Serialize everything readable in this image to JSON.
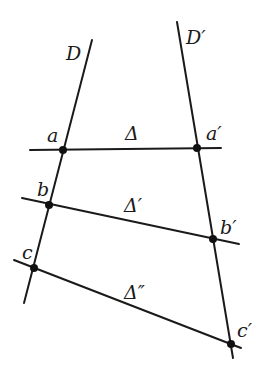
{
  "diagram": {
    "type": "geometry-transversals",
    "stroke_color": "#1a1a1a",
    "background": "#ffffff",
    "lines": [
      {
        "id": "D",
        "label": "D",
        "x1": 92,
        "y1": 40,
        "x2": 24,
        "y2": 303
      },
      {
        "id": "D-prime",
        "label": "D′",
        "x1": 177,
        "y1": 22,
        "x2": 233,
        "y2": 358
      },
      {
        "id": "delta",
        "label": "Δ",
        "x1": 30,
        "y1": 150,
        "x2": 221,
        "y2": 148
      },
      {
        "id": "delta-prime",
        "label": "Δ′",
        "x1": 22,
        "y1": 198,
        "x2": 239,
        "y2": 244
      },
      {
        "id": "delta-double-prime",
        "label": "Δ″",
        "x1": 14,
        "y1": 260,
        "x2": 241,
        "y2": 348
      }
    ],
    "points": [
      {
        "id": "a",
        "label": "a",
        "x": 63,
        "y": 150
      },
      {
        "id": "a-prime",
        "label": "a′",
        "x": 197,
        "y": 148
      },
      {
        "id": "b",
        "label": "b",
        "x": 49,
        "y": 205
      },
      {
        "id": "b-prime",
        "label": "b′",
        "x": 213,
        "y": 239
      },
      {
        "id": "c",
        "label": "c",
        "x": 34,
        "y": 268
      },
      {
        "id": "c-prime",
        "label": "c′",
        "x": 231,
        "y": 344
      }
    ],
    "labels": {
      "D": "D",
      "D_prime": "D′",
      "delta": "Δ",
      "delta_prime": "Δ′",
      "delta_double_prime": "Δ″",
      "a": "a",
      "a_prime": "a′",
      "b": "b",
      "b_prime": "b′",
      "c": "c",
      "c_prime": "c′"
    }
  }
}
